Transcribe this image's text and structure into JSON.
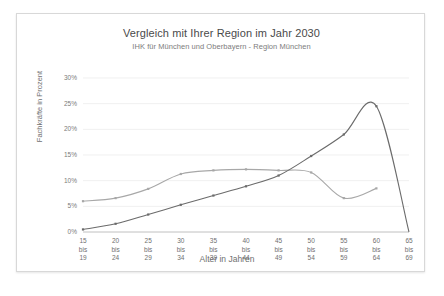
{
  "chart_data": {
    "type": "line",
    "title": "Vergleich mit Ihrer Region im Jahr 2030",
    "subtitle": "IHK für München und Oberbayern - Region München",
    "xlabel": "Alter in Jahren",
    "ylabel": "Fachkräfte in Prozent",
    "categories": [
      "15 bis 19",
      "20 bis 24",
      "25 bis 29",
      "30 bis 34",
      "35 bis 39",
      "40 bis 44",
      "45 bis 49",
      "50 bis 54",
      "55 bis 59",
      "60 bis 64",
      "65 bis 69"
    ],
    "category_lines": [
      [
        "15",
        "bis",
        "19"
      ],
      [
        "20",
        "bis",
        "24"
      ],
      [
        "25",
        "bis",
        "29"
      ],
      [
        "30",
        "bis",
        "34"
      ],
      [
        "35",
        "bis",
        "39"
      ],
      [
        "40",
        "bis",
        "44"
      ],
      [
        "45",
        "bis",
        "49"
      ],
      [
        "50",
        "bis",
        "54"
      ],
      [
        "55",
        "bis",
        "59"
      ],
      [
        "60",
        "bis",
        "64"
      ],
      [
        "65",
        "bis",
        "69"
      ]
    ],
    "ylim": [
      0,
      30
    ],
    "yticks": [
      0,
      5,
      10,
      15,
      20,
      25,
      30
    ],
    "ytick_labels": [
      "0%",
      "5%",
      "10%",
      "15%",
      "20%",
      "25%",
      "30%"
    ],
    "grid": true,
    "legend": "none",
    "series": [
      {
        "name": "Region München",
        "color": "#a8a8a8",
        "values": [
          6.0,
          6.6,
          8.4,
          11.3,
          12.0,
          12.2,
          12.0,
          11.6,
          6.6,
          8.5,
          null
        ]
      },
      {
        "name": "Vergleich",
        "color": "#6b6b6b",
        "values": [
          0.5,
          1.6,
          3.4,
          5.3,
          7.1,
          8.9,
          11.0,
          14.8,
          19.0,
          24.5,
          0.0
        ]
      }
    ]
  }
}
